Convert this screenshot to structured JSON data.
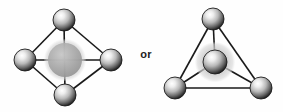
{
  "figure": {
    "conjunction_label": "or",
    "background_color": "#fefefe",
    "bond_color": "#1a1a1a",
    "atom_dark_color": "#2b2b2b",
    "atom_highlight_color": "#f2f2f2",
    "halo_color": "#b4b4b4",
    "center_atom_color": "#8c8c8c"
  },
  "structures": [
    {
      "name": "square-planar-structure",
      "label": "Square planar / octahedral projection",
      "center": {
        "name": "central-atom",
        "cx": 65,
        "cy": 60,
        "r": 17,
        "style": "gray-translucent",
        "halo_r": 21
      },
      "atoms": [
        {
          "name": "atom-top",
          "cx": 64,
          "cy": 20,
          "r": 11,
          "style": "dark-shaded"
        },
        {
          "name": "atom-left",
          "cx": 25,
          "cy": 60,
          "r": 11,
          "style": "dark-shaded"
        },
        {
          "name": "atom-right",
          "cx": 111,
          "cy": 60,
          "r": 11,
          "style": "dark-shaded"
        },
        {
          "name": "atom-bottom",
          "cx": 65,
          "cy": 95,
          "r": 11,
          "style": "dark-shaded"
        }
      ],
      "bonds": [
        {
          "name": "bond-top-left",
          "from": "atom-top",
          "to": "atom-left"
        },
        {
          "name": "bond-top-right",
          "from": "atom-top",
          "to": "atom-right"
        },
        {
          "name": "bond-bottom-left",
          "from": "atom-bottom",
          "to": "atom-left"
        },
        {
          "name": "bond-bottom-right",
          "from": "atom-bottom",
          "to": "atom-right"
        },
        {
          "name": "bond-vertical-axis",
          "from": "atom-top",
          "to": "atom-bottom"
        },
        {
          "name": "bond-horizontal-axis",
          "from": "atom-left",
          "to": "atom-right"
        }
      ]
    },
    {
      "name": "tetrahedral-structure",
      "label": "Tetrahedral projection",
      "center": {
        "name": "central-atom",
        "cx": 215,
        "cy": 62,
        "r": 12,
        "style": "dark-shaded",
        "halo_r": 20
      },
      "atoms": [
        {
          "name": "atom-top",
          "cx": 213,
          "cy": 19,
          "r": 11,
          "style": "dark-shaded"
        },
        {
          "name": "atom-bottom-left",
          "cx": 175,
          "cy": 88,
          "r": 11,
          "style": "dark-shaded"
        },
        {
          "name": "atom-bottom-right",
          "cx": 261,
          "cy": 88,
          "r": 11,
          "style": "dark-shaded"
        }
      ],
      "bonds": [
        {
          "name": "bond-top-bottom-left",
          "from": "atom-top",
          "to": "atom-bottom-left"
        },
        {
          "name": "bond-top-bottom-right",
          "from": "atom-top",
          "to": "atom-bottom-right"
        },
        {
          "name": "bond-bottom-left-bottom-right",
          "from": "atom-bottom-left",
          "to": "atom-bottom-right"
        },
        {
          "name": "bond-center-top",
          "from": "central-atom",
          "to": "atom-top"
        },
        {
          "name": "bond-center-bottom-left",
          "from": "central-atom",
          "to": "atom-bottom-left"
        },
        {
          "name": "bond-center-bottom-right",
          "from": "central-atom",
          "to": "atom-bottom-right"
        }
      ]
    }
  ]
}
